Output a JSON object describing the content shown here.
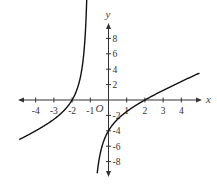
{
  "chart_data": {
    "type": "line",
    "title": "",
    "xlabel": "x",
    "ylabel": "y",
    "origin_label": "O",
    "function": "y = (x^2 - 4) / (x + 1)",
    "vertical_asymptote": -1,
    "slant_asymptote": "y = x - 1",
    "x_ticks": [
      -4,
      -3,
      -2,
      -1,
      1,
      2,
      3,
      4
    ],
    "x_tick_labels": [
      "-4",
      "-3",
      "-2",
      "-1",
      "1",
      "2",
      "3",
      "4"
    ],
    "y_ticks": [
      8,
      6,
      4,
      2,
      -2,
      -4,
      -6,
      -8
    ],
    "y_tick_labels": [
      "8",
      "6",
      "4",
      "2",
      "-2",
      "-4",
      "-6",
      "-8"
    ],
    "xlim": [
      -5,
      5.2
    ],
    "ylim": [
      -10,
      10
    ],
    "grid": false,
    "key_points": [
      {
        "x": -2,
        "y": 0
      },
      {
        "x": 2,
        "y": 0
      },
      {
        "x": 0,
        "y": -4
      }
    ],
    "series": [
      {
        "name": "left branch",
        "x": [
          -4.9,
          -4,
          -3,
          -2.5,
          -2,
          -1.8,
          -1.6,
          -1.4,
          -1.3,
          -1.2
        ],
        "y": [
          -5.13,
          -4.0,
          -2.5,
          -1.5,
          0.0,
          1.2,
          2.6,
          5.1,
          7.7,
          12.8
        ]
      },
      {
        "name": "right branch",
        "x": [
          -0.55,
          -0.5,
          -0.4,
          -0.2,
          0,
          0.5,
          1,
          2,
          3,
          4,
          5
        ],
        "y": [
          -8.2,
          -7.5,
          -6.4,
          -5.0,
          -4.0,
          -2.5,
          -1.5,
          0.0,
          1.25,
          2.4,
          3.5
        ]
      }
    ],
    "colors": {
      "curve": "#111111",
      "axis": "#333333",
      "text": "#333333"
    }
  }
}
